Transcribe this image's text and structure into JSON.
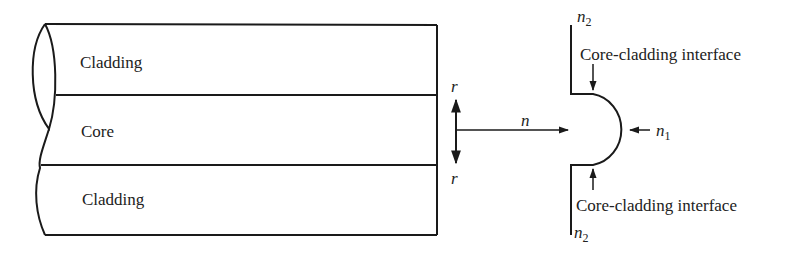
{
  "fiber": {
    "top_layer_label": "Cladding",
    "middle_layer_label": "Core",
    "bottom_layer_label": "Cladding"
  },
  "radial_arrow": {
    "top_label": "r",
    "bottom_label": "r"
  },
  "index_arrow": {
    "label": "n"
  },
  "profile": {
    "top_index_symbol": "n",
    "top_index_subscript": "2",
    "bottom_index_symbol": "n",
    "bottom_index_subscript": "2",
    "core_index_symbol": "n",
    "core_index_subscript": "1",
    "top_interface_label": "Core-cladding interface",
    "bottom_interface_label": "Core-cladding interface"
  },
  "colors": {
    "line": "#1a1a1a",
    "text": "#222222",
    "background": "#ffffff"
  }
}
